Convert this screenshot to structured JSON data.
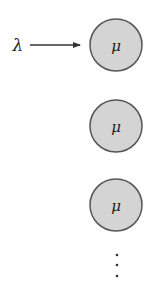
{
  "diagram": {
    "type": "queueing-system",
    "arrival": {
      "symbol": "λ",
      "label": "arrival rate"
    },
    "servers": [
      {
        "symbol": "μ",
        "cx": 116,
        "cy": 45
      },
      {
        "symbol": "μ",
        "cx": 116,
        "cy": 126
      },
      {
        "symbol": "μ",
        "cx": 116,
        "cy": 205
      }
    ],
    "continuation": "⋮",
    "colors": {
      "server_fill": "#d4d4d4",
      "server_stroke": "#555555",
      "arrow": "#333333",
      "text": "#222222"
    }
  }
}
